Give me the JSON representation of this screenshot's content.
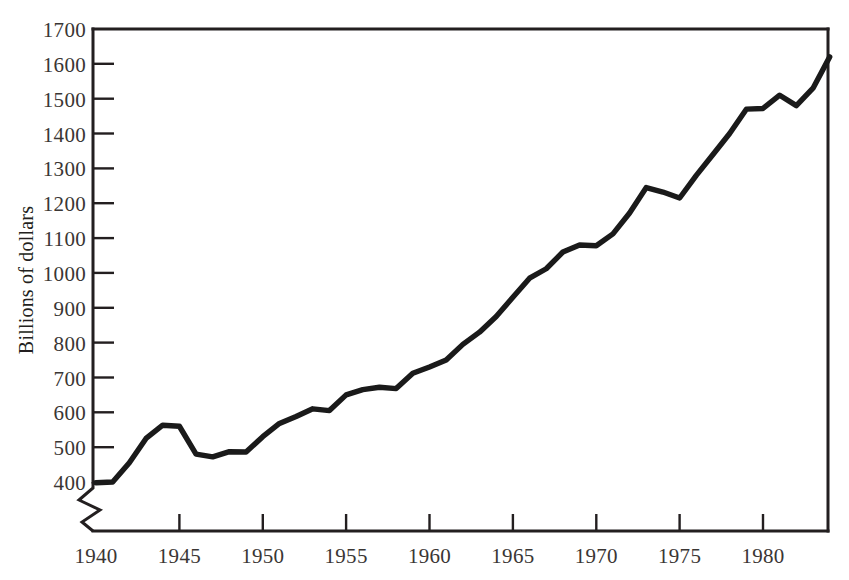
{
  "chart_data": {
    "type": "line",
    "title": "",
    "subtitle": "",
    "xlabel": "",
    "ylabel": "Billions of dollars",
    "xlim": [
      1940,
      1984
    ],
    "ylim": [
      370,
      1700
    ],
    "y_axis_break": true,
    "y_axis_break_note": "zigzag break between axis origin and 400",
    "grid": false,
    "legend": null,
    "x_ticks": [
      1940,
      1945,
      1950,
      1955,
      1960,
      1965,
      1970,
      1975,
      1980
    ],
    "x_tick_labels": [
      "1940",
      "1945",
      "1950",
      "1955",
      "1960",
      "1965",
      "1970",
      "1975",
      "1980"
    ],
    "y_ticks": [
      400,
      500,
      600,
      700,
      800,
      900,
      1000,
      1100,
      1200,
      1300,
      1400,
      1500,
      1600,
      1700
    ],
    "y_tick_labels": [
      "400",
      "500",
      "600",
      "700",
      "800",
      "900",
      "1000",
      "1100",
      "1200",
      "1300",
      "1400",
      "1500",
      "1600",
      "1700"
    ],
    "line_color": "#1a1a1a",
    "axis_color": "#231f20",
    "background_color": "#ffffff",
    "x": [
      1940,
      1941,
      1942,
      1943,
      1944,
      1945,
      1946,
      1947,
      1948,
      1949,
      1950,
      1951,
      1952,
      1953,
      1954,
      1955,
      1956,
      1957,
      1958,
      1959,
      1960,
      1961,
      1962,
      1963,
      1964,
      1965,
      1966,
      1967,
      1968,
      1969,
      1970,
      1971,
      1972,
      1973,
      1974,
      1975,
      1976,
      1977,
      1978,
      1979,
      1980,
      1981,
      1982,
      1983,
      1984
    ],
    "values": [
      398,
      400,
      455,
      525,
      563,
      560,
      480,
      472,
      487,
      486,
      530,
      568,
      588,
      610,
      605,
      650,
      665,
      672,
      668,
      712,
      730,
      750,
      795,
      830,
      875,
      930,
      985,
      1012,
      1060,
      1080,
      1078,
      1112,
      1172,
      1245,
      1232,
      1215,
      1280,
      1340,
      1400,
      1470,
      1472,
      1510,
      1480,
      1530,
      1620
    ],
    "series": [
      {
        "name": "Billions of dollars",
        "values": [
          398,
          400,
          455,
          525,
          563,
          560,
          480,
          472,
          487,
          486,
          530,
          568,
          588,
          610,
          605,
          650,
          665,
          672,
          668,
          712,
          730,
          750,
          795,
          830,
          875,
          930,
          985,
          1012,
          1060,
          1080,
          1078,
          1112,
          1172,
          1245,
          1232,
          1215,
          1280,
          1340,
          1400,
          1470,
          1472,
          1510,
          1480,
          1530,
          1620
        ]
      }
    ],
    "annotations": []
  }
}
